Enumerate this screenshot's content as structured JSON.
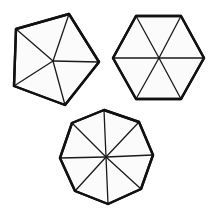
{
  "diagram": {
    "background": "#ffffff",
    "stroke_color": "#111111",
    "fill_color": "#fbfbfb",
    "shapes": [
      {
        "name": "pentagon",
        "sides": 5,
        "center": [
          53,
          61
        ],
        "vertices": [
          [
            16,
            29
          ],
          [
            69,
            14
          ],
          [
            99,
            62
          ],
          [
            65,
            105
          ],
          [
            14,
            86
          ]
        ]
      },
      {
        "name": "hexagon",
        "sides": 6,
        "center": [
          159,
          58
        ],
        "vertices": [
          [
            136,
            16
          ],
          [
            181,
            16
          ],
          [
            204,
            58
          ],
          [
            181,
            99
          ],
          [
            136,
            99
          ],
          [
            113,
            58
          ]
        ]
      },
      {
        "name": "octagon",
        "sides": 8,
        "center": [
          106,
          157
        ],
        "vertices": [
          [
            104,
            110
          ],
          [
            139,
            122
          ],
          [
            153,
            155
          ],
          [
            141,
            189
          ],
          [
            108,
            204
          ],
          [
            75,
            191
          ],
          [
            60,
            158
          ],
          [
            72,
            123
          ]
        ]
      }
    ]
  }
}
